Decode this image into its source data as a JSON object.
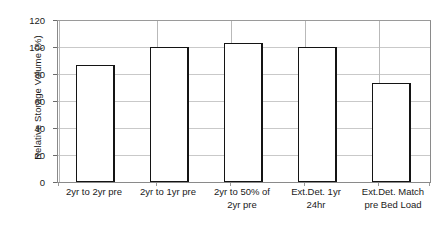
{
  "chart_data": {
    "type": "bar",
    "title": "",
    "xlabel": "",
    "ylabel": "Relative Storage Volume (%)",
    "ylim": [
      0,
      120
    ],
    "yticks": [
      0,
      20,
      40,
      60,
      80,
      100,
      120
    ],
    "grid": true,
    "legend": "none",
    "categories": [
      "2yr to 2yr pre",
      "2yr to 1yr pre",
      "2yr to 50% of\n2yr pre",
      "Ext.Det. 1yr\n24hr",
      "Ext.Det. Match\npre Bed Load"
    ],
    "values": [
      87,
      101,
      103.5,
      101,
      74
    ],
    "bar_style": {
      "fill": "#ffffff",
      "edge": "#141414",
      "gridline_color": "#c9c9c9",
      "frame_color": "#8a8a8a"
    }
  }
}
